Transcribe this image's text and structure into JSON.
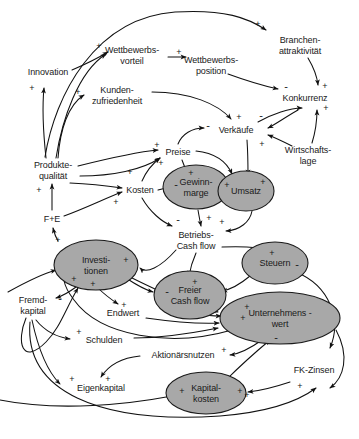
{
  "diagram": {
    "type": "causal-loop-diagram",
    "colors": {
      "node_fill_highlight": "#a8a8a8",
      "node_stroke": "#1a1a1a",
      "background": "#ffffff",
      "text": "#1a1a1a"
    },
    "nodes": [
      {
        "id": "innovation",
        "label": "Innovation",
        "x": 48,
        "y": 72,
        "shape": "plain",
        "lines": [
          "Innovation"
        ]
      },
      {
        "id": "wettbewerbsvorteil",
        "label": "Wettbewerbs-\nvorteil",
        "x": 132,
        "y": 55,
        "shape": "plain",
        "lines": [
          "Wettbewerbs-",
          "vorteil"
        ]
      },
      {
        "id": "wettbewerbsposition",
        "label": "Wettbewerbs-\nposition",
        "x": 211,
        "y": 65,
        "shape": "plain",
        "lines": [
          "Wettbewerbs-",
          "position"
        ]
      },
      {
        "id": "branchenattraktivitaet",
        "label": "Branchen-\nattraktivität",
        "x": 300,
        "y": 45,
        "shape": "plain",
        "lines": [
          "Branchen-",
          "attraktivität"
        ]
      },
      {
        "id": "kundenzufriedenheit",
        "label": "Kunden-\nzufriedenheit",
        "x": 117,
        "y": 95,
        "shape": "plain",
        "lines": [
          "Kunden-",
          "zufriedenheit"
        ]
      },
      {
        "id": "konkurrenz",
        "label": "Konkurrenz",
        "x": 305,
        "y": 98,
        "shape": "plain",
        "lines": [
          "Konkurrenz"
        ]
      },
      {
        "id": "verkaeufe",
        "label": "Verkäufe",
        "x": 236,
        "y": 130,
        "shape": "plain",
        "lines": [
          "Verkäufe"
        ]
      },
      {
        "id": "wirtschaftslage",
        "label": "Wirtschafts-\nlage",
        "x": 308,
        "y": 155,
        "shape": "plain",
        "lines": [
          "Wirtschafts-",
          "lage"
        ]
      },
      {
        "id": "preise",
        "label": "Preise",
        "x": 178,
        "y": 152,
        "shape": "plain",
        "lines": [
          "Preise"
        ]
      },
      {
        "id": "produktequalitaet",
        "label": "Produkte-\nqualität",
        "x": 53,
        "y": 170,
        "shape": "plain",
        "lines": [
          "Produkte-",
          "qualität"
        ]
      },
      {
        "id": "kosten",
        "label": "Kosten",
        "x": 140,
        "y": 190,
        "shape": "plain",
        "lines": [
          "Kosten"
        ]
      },
      {
        "id": "gewinnmarge",
        "label": "Gewinn-\nmarge",
        "x": 196,
        "y": 187,
        "shape": "ellipse",
        "rx": 33,
        "ry": 22,
        "lines": [
          "Gewinn-",
          "marge"
        ]
      },
      {
        "id": "umsatz",
        "label": "Umsatz",
        "x": 246,
        "y": 191,
        "shape": "ellipse",
        "rx": 28,
        "ry": 20,
        "lines": [
          "Umsatz"
        ]
      },
      {
        "id": "fue",
        "label": "F+E",
        "x": 52,
        "y": 219,
        "shape": "plain",
        "lines": [
          "F+E"
        ]
      },
      {
        "id": "betriebscashflow",
        "label": "Betriebs-\nCash flow",
        "x": 196,
        "y": 240,
        "shape": "plain",
        "lines": [
          "Betriebs-",
          "Cash flow"
        ]
      },
      {
        "id": "investitionen",
        "label": "Investi-\ntionen",
        "x": 96,
        "y": 265,
        "shape": "ellipse",
        "rx": 42,
        "ry": 25,
        "lines": [
          "Investi-",
          "tionen"
        ]
      },
      {
        "id": "steuern",
        "label": "Steuern",
        "x": 275,
        "y": 263,
        "shape": "ellipse",
        "rx": 33,
        "ry": 21,
        "lines": [
          "Steuern"
        ]
      },
      {
        "id": "freiercashflow",
        "label": "Freier\nCash flow",
        "x": 190,
        "y": 295,
        "shape": "ellipse",
        "rx": 36,
        "ry": 24,
        "lines": [
          "Freier",
          "Cash flow"
        ]
      },
      {
        "id": "fremdkapital",
        "label": "Fremd-\nkapital",
        "x": 33,
        "y": 305,
        "shape": "plain",
        "lines": [
          "Fremd-",
          "kapital"
        ]
      },
      {
        "id": "unternehmenswert",
        "label": "Unternehmens -\nwert",
        "x": 280,
        "y": 318,
        "shape": "ellipse",
        "rx": 60,
        "ry": 26,
        "lines": [
          "Unternehmens -",
          "wert"
        ]
      },
      {
        "id": "endwert",
        "label": "Endwert",
        "x": 123,
        "y": 313,
        "shape": "plain",
        "lines": [
          "Endwert"
        ]
      },
      {
        "id": "schulden",
        "label": "Schulden",
        "x": 104,
        "y": 340,
        "shape": "plain",
        "lines": [
          "Schulden"
        ]
      },
      {
        "id": "aktionaersnutzen",
        "label": "Aktionärsnutzen",
        "x": 183,
        "y": 355,
        "shape": "plain",
        "lines": [
          "Aktionärsnutzen"
        ]
      },
      {
        "id": "fkzinsen",
        "label": "FK-Zinsen",
        "x": 314,
        "y": 370,
        "shape": "plain",
        "lines": [
          "FK-Zinsen"
        ]
      },
      {
        "id": "eigenkapital",
        "label": "Eigenkapital",
        "x": 101,
        "y": 388,
        "shape": "plain",
        "lines": [
          "Eigenkapital"
        ]
      },
      {
        "id": "kapitalkosten",
        "label": "Kapital-\nkosten",
        "x": 206,
        "y": 393,
        "shape": "ellipse",
        "rx": 40,
        "ry": 21,
        "lines": [
          "Kapital-",
          "kosten"
        ]
      }
    ],
    "signs": [
      {
        "polarity": "+",
        "x": 258,
        "y": 24
      },
      {
        "polarity": "+",
        "x": 99,
        "y": 46
      },
      {
        "polarity": "+",
        "x": 179,
        "y": 52
      },
      {
        "polarity": "+",
        "x": 32,
        "y": 88
      },
      {
        "polarity": "+",
        "x": 78,
        "y": 92
      },
      {
        "polarity": "-",
        "x": 286,
        "y": 86
      },
      {
        "polarity": "+",
        "x": 325,
        "y": 86
      },
      {
        "polarity": "+",
        "x": 326,
        "y": 108
      },
      {
        "polarity": "-",
        "x": 261,
        "y": 115
      },
      {
        "polarity": "+",
        "x": 239,
        "y": 117
      },
      {
        "polarity": "-",
        "x": 208,
        "y": 125
      },
      {
        "polarity": "+",
        "x": 262,
        "y": 144
      },
      {
        "polarity": "+",
        "x": 157,
        "y": 145
      },
      {
        "polarity": "+",
        "x": 161,
        "y": 163
      },
      {
        "polarity": "+",
        "x": 191,
        "y": 173
      },
      {
        "polarity": "+",
        "x": 130,
        "y": 172
      },
      {
        "polarity": "-",
        "x": 176,
        "y": 184
      },
      {
        "polarity": "+",
        "x": 227,
        "y": 185
      },
      {
        "polarity": "+",
        "x": 263,
        "y": 182
      },
      {
        "polarity": "+",
        "x": 39,
        "y": 190
      },
      {
        "polarity": "+",
        "x": 116,
        "y": 202
      },
      {
        "polarity": "-",
        "x": 178,
        "y": 219
      },
      {
        "polarity": "+",
        "x": 209,
        "y": 218
      },
      {
        "polarity": "+",
        "x": 222,
        "y": 222
      },
      {
        "polarity": "+",
        "x": 58,
        "y": 240
      },
      {
        "polarity": "+",
        "x": 126,
        "y": 260
      },
      {
        "polarity": "+",
        "x": 272,
        "y": 253
      },
      {
        "polarity": "-",
        "x": 297,
        "y": 264
      },
      {
        "polarity": "+",
        "x": 74,
        "y": 279
      },
      {
        "polarity": "+",
        "x": 93,
        "y": 284
      },
      {
        "polarity": "+",
        "x": 195,
        "y": 282
      },
      {
        "polarity": "-",
        "x": 60,
        "y": 298
      },
      {
        "polarity": "-",
        "x": 167,
        "y": 291
      },
      {
        "polarity": "+",
        "x": 247,
        "y": 307
      },
      {
        "polarity": "+",
        "x": 124,
        "y": 305
      },
      {
        "polarity": "+",
        "x": 243,
        "y": 318
      },
      {
        "polarity": "+",
        "x": 79,
        "y": 332
      },
      {
        "polarity": "-",
        "x": 276,
        "y": 337
      },
      {
        "polarity": "+",
        "x": 224,
        "y": 350
      },
      {
        "polarity": "+",
        "x": 72,
        "y": 379
      },
      {
        "polarity": "+",
        "x": 108,
        "y": 379
      },
      {
        "polarity": "+",
        "x": 182,
        "y": 391
      },
      {
        "polarity": "+",
        "x": 240,
        "y": 391
      },
      {
        "polarity": "+",
        "x": 247,
        "y": 395
      },
      {
        "polarity": "+",
        "x": 300,
        "y": 386
      }
    ],
    "edges": [
      {
        "from": "produktequalitaet",
        "to": "branchenattraktivitaet",
        "polarity": "+"
      },
      {
        "from": "innovation",
        "to": "wettbewerbsvorteil",
        "polarity": "+"
      },
      {
        "from": "produktequalitaet",
        "to": "innovation",
        "polarity": "+"
      },
      {
        "from": "produktequalitaet",
        "to": "kundenzufriedenheit",
        "polarity": "+"
      },
      {
        "from": "wettbewerbsvorteil",
        "to": "wettbewerbsposition",
        "polarity": "+"
      },
      {
        "from": "wettbewerbsposition",
        "to": "konkurrenz",
        "polarity": "-"
      },
      {
        "from": "branchenattraktivitaet",
        "to": "konkurrenz",
        "polarity": "+"
      },
      {
        "from": "wirtschaftslage",
        "to": "konkurrenz",
        "polarity": "+"
      },
      {
        "from": "konkurrenz",
        "to": "verkaeufe",
        "polarity": "-"
      },
      {
        "from": "wirtschaftslage",
        "to": "verkaeufe",
        "polarity": "+"
      },
      {
        "from": "kundenzufriedenheit",
        "to": "verkaeufe",
        "polarity": "+"
      },
      {
        "from": "preise",
        "to": "verkaeufe",
        "polarity": "-"
      },
      {
        "from": "produktequalitaet",
        "to": "preise",
        "polarity": "+"
      },
      {
        "from": "kosten",
        "to": "preise",
        "polarity": "+"
      },
      {
        "from": "produktequalitaet",
        "to": "kosten",
        "polarity": "+"
      },
      {
        "from": "preise",
        "to": "gewinnmarge",
        "polarity": "+"
      },
      {
        "from": "kosten",
        "to": "gewinnmarge",
        "polarity": "-"
      },
      {
        "from": "verkaeufe",
        "to": "umsatz",
        "polarity": "+"
      },
      {
        "from": "preise",
        "to": "umsatz",
        "polarity": "+"
      },
      {
        "from": "gewinnmarge",
        "to": "betriebscashflow",
        "polarity": "+"
      },
      {
        "from": "umsatz",
        "to": "betriebscashflow",
        "polarity": "+"
      },
      {
        "from": "kosten",
        "to": "betriebscashflow",
        "polarity": "-"
      },
      {
        "from": "fue",
        "to": "produktequalitaet",
        "polarity": "+"
      },
      {
        "from": "fue",
        "to": "kosten",
        "polarity": "+"
      },
      {
        "from": "investitionen",
        "to": "fue",
        "polarity": "+"
      },
      {
        "from": "betriebscashflow",
        "to": "investitionen",
        "polarity": "+"
      },
      {
        "from": "investitionen",
        "to": "endwert",
        "polarity": "+"
      },
      {
        "from": "investitionen",
        "to": "fremdkapital",
        "polarity": "-"
      },
      {
        "from": "betriebscashflow",
        "to": "freiercashflow",
        "polarity": "+"
      },
      {
        "from": "investitionen",
        "to": "freiercashflow",
        "polarity": "-"
      },
      {
        "from": "steuern",
        "to": "freiercashflow",
        "polarity": "-"
      },
      {
        "from": "betriebscashflow",
        "to": "steuern",
        "polarity": "+"
      },
      {
        "from": "freiercashflow",
        "to": "unternehmenswert",
        "polarity": "+"
      },
      {
        "from": "endwert",
        "to": "unternehmenswert",
        "polarity": "+"
      },
      {
        "from": "schulden",
        "to": "unternehmenswert",
        "polarity": "+"
      },
      {
        "from": "kapitalkosten",
        "to": "unternehmenswert",
        "polarity": "-"
      },
      {
        "from": "unternehmenswert",
        "to": "aktionaersnutzen",
        "polarity": "+"
      },
      {
        "from": "fremdkapital",
        "to": "schulden",
        "polarity": "+"
      },
      {
        "from": "fremdkapital",
        "to": "eigenkapital",
        "polarity": "-"
      },
      {
        "from": "aktionaersnutzen",
        "to": "eigenkapital",
        "polarity": "+"
      },
      {
        "from": "eigenkapital",
        "to": "kapitalkosten",
        "polarity": "+"
      },
      {
        "from": "fkzinsen",
        "to": "kapitalkosten",
        "polarity": "+"
      },
      {
        "from": "fremdkapital",
        "to": "fkzinsen",
        "polarity": "+"
      },
      {
        "from": "steuern",
        "to": "unternehmenswert",
        "polarity": "-"
      }
    ]
  }
}
